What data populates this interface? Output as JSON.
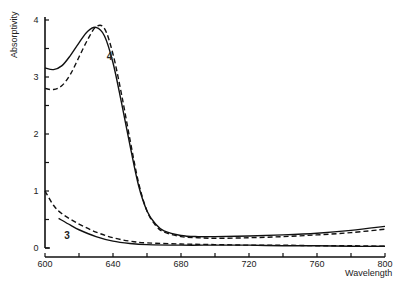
{
  "chart_data": {
    "type": "line",
    "title": "",
    "xlabel": "Wavelength",
    "ylabel": "Absorptivity",
    "xlim": [
      600,
      800
    ],
    "ylim": [
      0,
      4
    ],
    "grid": false,
    "legend": "none (curves labeled inline: 3, 4)",
    "x_ticks": [
      600,
      620,
      640,
      660,
      680,
      700,
      720,
      740,
      760,
      780,
      800
    ],
    "x_tick_labels": [
      "600",
      "",
      "640",
      "",
      "680",
      "",
      "720",
      "",
      "760",
      "",
      "800"
    ],
    "y_ticks": [
      0,
      0.5,
      1,
      1.5,
      2,
      2.5,
      3,
      3.5,
      4
    ],
    "y_tick_labels": [
      "0",
      "",
      "1",
      "",
      "2",
      "",
      "3",
      "",
      "4"
    ],
    "series": [
      {
        "name": "4 (solid)",
        "style": "solid",
        "x": [
          600,
          605,
          610,
          615,
          620,
          625,
          630,
          635,
          640,
          645,
          650,
          655,
          660,
          665,
          670,
          680,
          690,
          700,
          720,
          740,
          760,
          780,
          800
        ],
        "values": [
          3.16,
          3.13,
          3.2,
          3.38,
          3.6,
          3.8,
          3.87,
          3.72,
          3.25,
          2.55,
          1.8,
          1.1,
          0.65,
          0.42,
          0.3,
          0.22,
          0.2,
          0.2,
          0.21,
          0.23,
          0.26,
          0.31,
          0.38
        ]
      },
      {
        "name": "4 (dashed)",
        "style": "dashed",
        "x": [
          600,
          605,
          610,
          615,
          620,
          625,
          630,
          635,
          640,
          645,
          650,
          655,
          660,
          665,
          670,
          680,
          690,
          700,
          720,
          740,
          760,
          780,
          800
        ],
        "values": [
          2.8,
          2.78,
          2.85,
          3.05,
          3.35,
          3.65,
          3.88,
          3.85,
          3.4,
          2.7,
          1.9,
          1.15,
          0.65,
          0.4,
          0.28,
          0.2,
          0.18,
          0.17,
          0.18,
          0.2,
          0.23,
          0.27,
          0.33
        ]
      },
      {
        "name": "3 (solid)",
        "style": "solid",
        "x": [
          608,
          615,
          620,
          630,
          640,
          650,
          660,
          680,
          700,
          720,
          740,
          760,
          780,
          800
        ],
        "values": [
          0.52,
          0.4,
          0.32,
          0.2,
          0.12,
          0.08,
          0.06,
          0.05,
          0.05,
          0.05,
          0.04,
          0.04,
          0.03,
          0.03
        ]
      },
      {
        "name": "3 (dashed)",
        "style": "dashed",
        "x": [
          600,
          605,
          610,
          620,
          630,
          640,
          650,
          660,
          680,
          700,
          720,
          740,
          760,
          780,
          800
        ],
        "values": [
          1.0,
          0.75,
          0.6,
          0.42,
          0.28,
          0.18,
          0.12,
          0.09,
          0.07,
          0.06,
          0.05,
          0.05,
          0.04,
          0.04,
          0.03
        ]
      }
    ],
    "annotations": [
      {
        "text": "4",
        "x": 638,
        "y": 3.3
      },
      {
        "text": "3",
        "x": 613,
        "y": 0.15
      }
    ]
  }
}
